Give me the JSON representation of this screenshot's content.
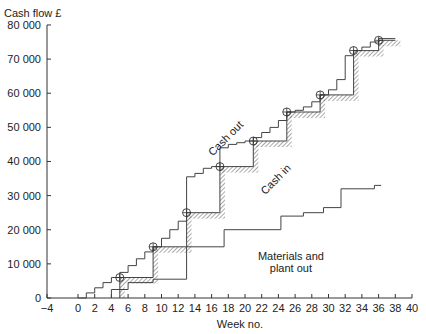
{
  "chart_data": {
    "type": "line",
    "title": "",
    "ylabel": "Cash flow £",
    "xlabel": "Week no.",
    "xlim": [
      -4,
      40
    ],
    "ylim": [
      0,
      80000
    ],
    "grid": false,
    "x_ticks": [
      -4,
      0,
      2,
      4,
      6,
      8,
      10,
      12,
      14,
      16,
      18,
      20,
      22,
      24,
      26,
      28,
      30,
      32,
      34,
      36,
      38,
      40
    ],
    "x_tick_labels": [
      "−4",
      "0",
      "2",
      "4",
      "6",
      "8",
      "10",
      "12",
      "14",
      "16",
      "18",
      "20",
      "22",
      "24",
      "26",
      "28",
      "30",
      "32",
      "34",
      "36",
      "38",
      "40"
    ],
    "y_ticks": [
      0,
      10000,
      20000,
      30000,
      40000,
      50000,
      60000,
      70000,
      80000
    ],
    "y_tick_labels": [
      "0",
      "10 000",
      "20 000",
      "30 000",
      "40 000",
      "50 000",
      "60 000",
      "70 000",
      "80 000"
    ],
    "series": [
      {
        "name": "Cash out",
        "style": "step",
        "points": [
          [
            0,
            0
          ],
          [
            1,
            0
          ],
          [
            1,
            1500
          ],
          [
            2,
            1500
          ],
          [
            2,
            3000
          ],
          [
            3,
            3000
          ],
          [
            3,
            4500
          ],
          [
            4,
            4500
          ],
          [
            4,
            6000
          ],
          [
            5,
            6000
          ],
          [
            5,
            7500
          ],
          [
            6,
            7500
          ],
          [
            6,
            9500
          ],
          [
            7,
            9500
          ],
          [
            7,
            11500
          ],
          [
            8,
            11500
          ],
          [
            8,
            13500
          ],
          [
            9,
            13500
          ],
          [
            9,
            15000
          ],
          [
            10,
            15000
          ],
          [
            10,
            17500
          ],
          [
            11,
            17500
          ],
          [
            11,
            20000
          ],
          [
            12,
            20000
          ],
          [
            12,
            22500
          ],
          [
            13,
            22500
          ],
          [
            13,
            35500
          ],
          [
            14,
            35500
          ],
          [
            14,
            36500
          ],
          [
            15,
            36500
          ],
          [
            15,
            38000
          ],
          [
            16,
            38000
          ],
          [
            16,
            38500
          ],
          [
            17,
            38500
          ],
          [
            17,
            44000
          ],
          [
            18,
            44000
          ],
          [
            18,
            45000
          ],
          [
            19,
            45000
          ],
          [
            19,
            45500
          ],
          [
            20,
            45500
          ],
          [
            20,
            46000
          ],
          [
            21,
            46000
          ],
          [
            21,
            47000
          ],
          [
            22,
            47000
          ],
          [
            22,
            48500
          ],
          [
            23,
            48500
          ],
          [
            23,
            50000
          ],
          [
            24,
            50000
          ],
          [
            24,
            52000
          ],
          [
            25,
            52000
          ],
          [
            25,
            54500
          ],
          [
            26,
            54500
          ],
          [
            26,
            55000
          ],
          [
            27,
            55000
          ],
          [
            27,
            56000
          ],
          [
            28,
            56000
          ],
          [
            28,
            57500
          ],
          [
            29,
            57500
          ],
          [
            29,
            59500
          ],
          [
            30,
            59500
          ],
          [
            30,
            61000
          ],
          [
            31,
            61000
          ],
          [
            31,
            64000
          ],
          [
            32,
            64000
          ],
          [
            32,
            71000
          ],
          [
            33,
            71000
          ],
          [
            33,
            72500
          ],
          [
            34,
            72500
          ],
          [
            34,
            73500
          ],
          [
            35,
            73500
          ],
          [
            35,
            75000
          ],
          [
            36,
            75000
          ],
          [
            36,
            76000
          ],
          [
            38,
            76000
          ]
        ]
      },
      {
        "name": "Cash in",
        "style": "step-hatched",
        "points": [
          [
            5,
            0
          ],
          [
            5,
            6000
          ],
          [
            9,
            6000
          ],
          [
            9,
            15000
          ],
          [
            13,
            15000
          ],
          [
            13,
            25000
          ],
          [
            17,
            25000
          ],
          [
            17,
            38500
          ],
          [
            21,
            38500
          ],
          [
            21,
            46000
          ],
          [
            25,
            46000
          ],
          [
            25,
            54500
          ],
          [
            29,
            54500
          ],
          [
            29,
            59500
          ],
          [
            33,
            59500
          ],
          [
            33,
            72500
          ],
          [
            36,
            72500
          ],
          [
            36,
            75500
          ],
          [
            38,
            75500
          ]
        ]
      },
      {
        "name": "Materials and plant out",
        "style": "step",
        "points": [
          [
            4,
            0
          ],
          [
            4,
            2500
          ],
          [
            6,
            2500
          ],
          [
            6,
            4500
          ],
          [
            9,
            4500
          ],
          [
            9,
            5500
          ],
          [
            13,
            5500
          ],
          [
            13,
            15000
          ],
          [
            17.5,
            15000
          ],
          [
            17.5,
            20000
          ],
          [
            24.3,
            20000
          ],
          [
            24.3,
            24000
          ],
          [
            27,
            24000
          ],
          [
            27,
            25000
          ],
          [
            29.4,
            25000
          ],
          [
            29.4,
            26500
          ],
          [
            31.5,
            26500
          ],
          [
            31.5,
            32000
          ],
          [
            35.5,
            32000
          ],
          [
            35.5,
            33000
          ],
          [
            36.3,
            33000
          ]
        ]
      }
    ],
    "markers": {
      "shape": "circled-cross",
      "points": [
        [
          5,
          6000
        ],
        [
          9,
          15000
        ],
        [
          13,
          25000
        ],
        [
          17,
          38500
        ],
        [
          21,
          46000
        ],
        [
          25,
          54500
        ],
        [
          29,
          59500
        ],
        [
          33,
          72500
        ],
        [
          36,
          75500
        ]
      ]
    },
    "annotations": [
      {
        "text": "Cash out",
        "x": 18,
        "y": 46000,
        "rotation": -45
      },
      {
        "text": "Cash in",
        "x": 24,
        "y": 34000,
        "rotation": -45
      },
      {
        "text": "Materials and",
        "x": 25.5,
        "y": 11000,
        "rotation": 0
      },
      {
        "text": "plant out",
        "x": 25.5,
        "y": 7500,
        "rotation": 0
      }
    ]
  }
}
